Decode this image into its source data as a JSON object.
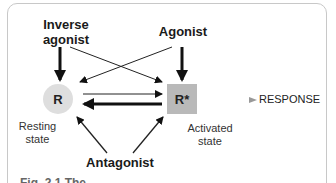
{
  "diagram": {
    "ligands": {
      "inverse_agonist": "Inverse\nagonist",
      "inverse_agonist_line1": "Inverse",
      "inverse_agonist_line2": "agonist",
      "agonist": "Agonist",
      "antagonist": "Antagonist"
    },
    "states": {
      "resting": {
        "symbol": "R",
        "label_line1": "Resting",
        "label_line2": "state",
        "color": "#dedede"
      },
      "activated": {
        "symbol": "R*",
        "label_line1": "Activated",
        "label_line2": "state",
        "color": "#b9b9b9"
      }
    },
    "output": "RESPONSE",
    "caption_fragment": "Fig. 2.1  The"
  }
}
